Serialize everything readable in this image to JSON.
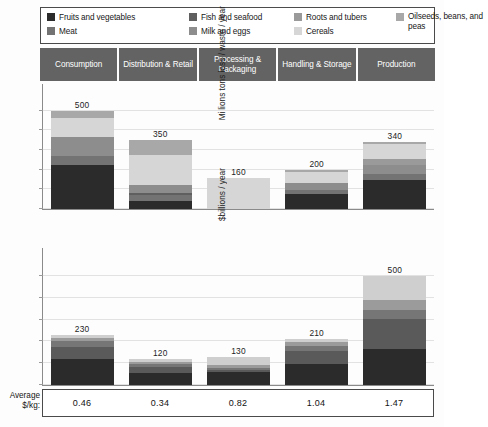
{
  "legend": {
    "items": [
      {
        "label": "Fruits and vegetables",
        "color": "#2b2b2b",
        "wrap": false
      },
      {
        "label": "Fish and seafood",
        "color": "#5f5f5f",
        "wrap": false
      },
      {
        "label": "Roots and tubers",
        "color": "#9a9a9a",
        "wrap": false
      },
      {
        "label": "Oilseeds, beans, and peas",
        "color": "#a8a8a8",
        "wrap": true
      },
      {
        "label": "Meat",
        "color": "#737373",
        "wrap": false
      },
      {
        "label": "Milk and eggs",
        "color": "#8d8d8d",
        "wrap": false
      },
      {
        "label": "Cereals",
        "color": "#d6d6d6",
        "wrap": false
      }
    ]
  },
  "stages": [
    "Consumption",
    "Distribution & Retail",
    "Processing & Packaging",
    "Handling & Storage",
    "Production"
  ],
  "average": {
    "label_line1": "Average",
    "label_line2": "$/kg:",
    "values": [
      "0.46",
      "0.34",
      "0.82",
      "1.04",
      "1.47"
    ]
  },
  "chart_data": [
    {
      "type": "bar",
      "id": "tonnage",
      "title": "",
      "xlabel": "",
      "ylabel": "Millions tons loss / waste / year",
      "ylim": [
        0,
        560
      ],
      "grid": true,
      "gridlines": [
        0,
        100,
        200,
        300,
        400,
        500
      ],
      "legend_position": "top",
      "stacked": true,
      "categories": [
        "Consumption",
        "Distribution & Retail",
        "Processing & Packaging",
        "Handling & Storage",
        "Production"
      ],
      "totals": [
        500,
        350,
        160,
        200,
        340
      ],
      "total_labels": [
        "500",
        "350",
        "160",
        "200",
        "340"
      ],
      "series": [
        {
          "name": "Fruits and vegetables",
          "color": "#2b2b2b",
          "values": [
            225,
            40,
            0,
            78,
            150
          ]
        },
        {
          "name": "Meat",
          "color": "#737373",
          "values": [
            45,
            32,
            0,
            20,
            30
          ]
        },
        {
          "name": "Fish and seafood",
          "color": "#5f5f5f",
          "values": [
            0,
            8,
            0,
            0,
            0
          ]
        },
        {
          "name": "Milk and eggs",
          "color": "#8d8d8d",
          "values": [
            95,
            42,
            0,
            36,
            45
          ]
        },
        {
          "name": "Roots and tubers",
          "color": "#9a9a9a",
          "values": [
            0,
            0,
            0,
            0,
            30
          ]
        },
        {
          "name": "Cereals",
          "color": "#d6d6d6",
          "values": [
            100,
            155,
            160,
            56,
            75
          ]
        },
        {
          "name": "Oilseeds, beans, and peas",
          "color": "#a8a8a8",
          "values": [
            35,
            73,
            0,
            10,
            10
          ]
        }
      ]
    },
    {
      "type": "bar",
      "id": "value",
      "title": "",
      "xlabel": "",
      "ylabel": "$billions / year",
      "ylim": [
        0,
        560
      ],
      "grid": true,
      "gridlines": [
        0,
        100,
        200,
        300,
        400,
        500
      ],
      "legend_position": "top",
      "stacked": true,
      "categories": [
        "Consumption",
        "Distribution & Retail",
        "Processing & Packaging",
        "Handling & Storage",
        "Production"
      ],
      "totals": [
        230,
        120,
        130,
        210,
        500
      ],
      "total_labels": [
        "230",
        "120",
        "130",
        "210",
        "500"
      ],
      "series": [
        {
          "name": "Fruits and vegetables",
          "color": "#2b2b2b",
          "values": [
            120,
            55,
            58,
            95,
            165
          ]
        },
        {
          "name": "Meat",
          "color": "#5a5a5a",
          "values": [
            55,
            28,
            12,
            62,
            140
          ]
        },
        {
          "name": "Fish and seafood",
          "color": "#767676",
          "values": [
            25,
            12,
            6,
            24,
            40
          ]
        },
        {
          "name": "Milk and eggs",
          "color": "#9b9b9b",
          "values": [
            18,
            13,
            14,
            18,
            45
          ]
        },
        {
          "name": "Cereals",
          "color": "#cfcfcf",
          "values": [
            12,
            12,
            40,
            11,
            110
          ]
        }
      ]
    }
  ]
}
